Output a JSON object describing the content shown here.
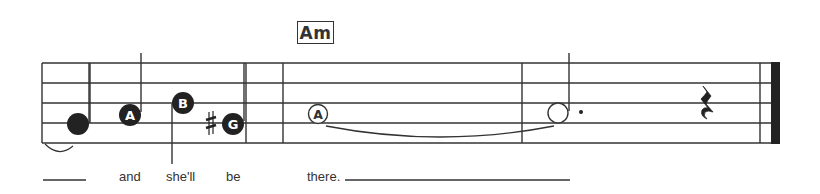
{
  "chord": {
    "label": "Am"
  },
  "staff": {
    "lines": 5,
    "top_y": 63,
    "spacing": 20,
    "left_x": 42,
    "right_x": 771,
    "line_color": "#333333"
  },
  "barlines": [
    {
      "x": 90,
      "type": "single"
    },
    {
      "x": 246,
      "type": "single"
    },
    {
      "x": 283,
      "type": "single"
    },
    {
      "x": 522,
      "type": "single"
    },
    {
      "x": 760,
      "type": "final"
    }
  ],
  "notes": [
    {
      "id": "note-1",
      "label": "",
      "x": 78,
      "y": 124,
      "filled": true,
      "stem": "none",
      "tie_from_prev": true
    },
    {
      "id": "note-2",
      "label": "A",
      "x": 130,
      "y": 114,
      "filled": true,
      "stem": "up"
    },
    {
      "id": "note-3",
      "label": "B",
      "x": 183,
      "y": 102,
      "filled": true,
      "stem": "down"
    },
    {
      "id": "note-4",
      "label": "G",
      "x": 233,
      "y": 124,
      "filled": true,
      "stem": "up",
      "accidental": "♯"
    },
    {
      "id": "note-5",
      "label": "A",
      "x": 318,
      "y": 114,
      "filled": false,
      "stem": "none",
      "type": "whole",
      "tie_to_next": true
    },
    {
      "id": "note-6",
      "label": "",
      "x": 558,
      "y": 114,
      "filled": false,
      "stem": "up",
      "type": "dotted-half"
    }
  ],
  "rest": {
    "type": "quarter",
    "x": 707,
    "symbol": "𝄽"
  },
  "lyrics": [
    {
      "text": "and",
      "x": 119
    },
    {
      "text": "she'll",
      "x": 166
    },
    {
      "text": "be",
      "x": 226
    },
    {
      "text": "there.",
      "x": 307
    }
  ],
  "extenders": [
    {
      "x1": 43,
      "x2": 86,
      "y": 180
    },
    {
      "x1": 345,
      "x2": 570,
      "y": 180
    }
  ]
}
